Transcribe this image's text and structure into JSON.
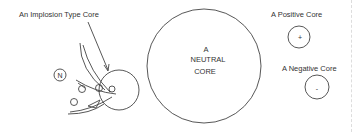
{
  "diagram": {
    "implosion": {
      "label": "An Implosion Type Core",
      "n_marker": "N"
    },
    "neutral": {
      "lines": [
        "A",
        "NEUTRAL",
        "CORE"
      ]
    },
    "positive": {
      "label": "A Positive Core",
      "sign": "+"
    },
    "negative": {
      "label": "A Negative Core",
      "sign": "-"
    }
  },
  "colors": {
    "stroke": "#444444",
    "text": "#333333",
    "background": "#ffffff"
  }
}
